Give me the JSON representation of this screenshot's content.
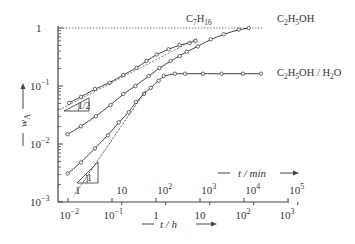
{
  "chart_data": {
    "type": "line",
    "title": "",
    "xlabel": "t / h",
    "xlabel_secondary": "t / min",
    "ylabel": "w_A",
    "xscale": "log",
    "yscale": "log",
    "xlim": [
      0.01,
      1000
    ],
    "ylim": [
      0.001,
      1
    ],
    "x_ticks": [
      "10^-2",
      "10^-1",
      "1",
      "10",
      "10^2",
      "10^3"
    ],
    "x_ticks_secondary": [
      "1",
      "10",
      "10^2",
      "10^3",
      "10^4",
      "10^5"
    ],
    "y_ticks": [
      "10^-3",
      "10^-2",
      "10^-1",
      "1"
    ],
    "grid": false,
    "reference_line": {
      "y": 1,
      "style": "dotted"
    },
    "annotations": [
      {
        "text": "1/2",
        "type": "slope-triangle",
        "near_series": "C7H16"
      },
      {
        "text": "1",
        "type": "slope-triangle",
        "near_series": "C2H5OH/H2O"
      }
    ],
    "series": [
      {
        "name": "C7H16",
        "x": [
          0.0105,
          0.0197,
          0.041,
          0.088,
          0.18,
          0.36,
          0.61,
          1.03,
          1.93,
          3.43,
          5.76,
          7.9
        ],
        "y": [
          0.051,
          0.065,
          0.089,
          0.113,
          0.155,
          0.205,
          0.27,
          0.35,
          0.43,
          0.51,
          0.55,
          0.6
        ]
      },
      {
        "name": "C2H5OH",
        "x": [
          0.0098,
          0.0197,
          0.043,
          0.093,
          0.18,
          0.34,
          0.68,
          1.2,
          2.15,
          3.45,
          4.98,
          8.9,
          17.6,
          34.8,
          76,
          128
        ],
        "y": [
          0.0147,
          0.0202,
          0.03,
          0.047,
          0.073,
          0.1,
          0.148,
          0.204,
          0.27,
          0.33,
          0.39,
          0.48,
          0.64,
          0.78,
          0.94,
          1.0
        ]
      },
      {
        "name": "C2H5OH/H2O",
        "x": [
          0.0098,
          0.0197,
          0.041,
          0.08,
          0.143,
          0.24,
          0.35,
          0.53,
          0.76,
          1.15,
          1.5,
          2.68,
          4.53,
          11.6,
          31,
          95,
          243
        ],
        "y": [
          0.0031,
          0.0048,
          0.0084,
          0.0141,
          0.0236,
          0.0353,
          0.053,
          0.073,
          0.093,
          0.123,
          0.15,
          0.163,
          0.163,
          0.163,
          0.163,
          0.163,
          0.163
        ]
      }
    ]
  },
  "labels": {
    "series_c7h16": "C7H16",
    "series_c2h5oh": "C2H5OH",
    "series_mix": "C2H5OH / H2O",
    "slope_half": "1/2",
    "slope_one": "1",
    "ylabel": "w",
    "ylabel_sub": "A",
    "xlabel": "t / h",
    "xlabel_min": "t / min"
  }
}
